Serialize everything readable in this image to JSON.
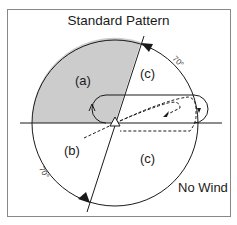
{
  "title": "Standard Pattern",
  "condition": "No Wind",
  "regions": {
    "a": "(a)",
    "b": "(b)",
    "c_upper": "(c)",
    "c_lower": "(c)"
  },
  "angles": {
    "upper_right": "70°",
    "lower_left": "70°"
  },
  "colors": {
    "shading": "#cccccc",
    "line": "#1a1a1a",
    "border": "#777777",
    "background": "#ffffff"
  },
  "icons": {
    "station": "triangle-icon",
    "sector_arrow": "arrowhead-icon",
    "turn_arrow": "turn-arrow-icon"
  }
}
